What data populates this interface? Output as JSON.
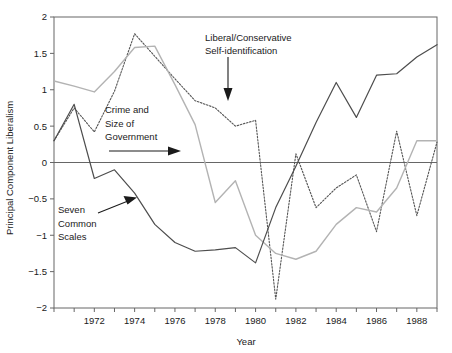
{
  "chart_data": {
    "type": "line",
    "title": "",
    "xlabel": "Year",
    "ylabel": "Principal Component Liberalism",
    "xlim": [
      1970,
      1989
    ],
    "ylim": [
      -2,
      2
    ],
    "x": [
      1970,
      1971,
      1972,
      1973,
      1974,
      1975,
      1976,
      1977,
      1978,
      1979,
      1980,
      1981,
      1982,
      1983,
      1984,
      1985,
      1986,
      1987,
      1988,
      1989
    ],
    "xticks": [
      1970,
      1971,
      1972,
      1973,
      1974,
      1975,
      1976,
      1977,
      1978,
      1979,
      1980,
      1981,
      1982,
      1983,
      1984,
      1985,
      1986,
      1987,
      1988,
      1989
    ],
    "xtick_labels": [
      "",
      "",
      "1972",
      "",
      "1974",
      "",
      "1976",
      "",
      "1978",
      "",
      "1980",
      "",
      "1982",
      "",
      "1984",
      "",
      "1986",
      "",
      "1988",
      ""
    ],
    "yticks": [
      -2,
      -1.5,
      -1,
      -0.5,
      0,
      0.5,
      1,
      1.5,
      2
    ],
    "ytick_labels": [
      "−2",
      "−1.5",
      "−1",
      "−0.5",
      "0",
      "0.5",
      "1",
      "1.5",
      "2"
    ],
    "grid": false,
    "legend": "none",
    "zero_line": true,
    "series": [
      {
        "name": "Crime and Size of Government",
        "style": "dotted",
        "color": "#555555",
        "values": [
          0.3,
          0.75,
          0.42,
          0.98,
          1.77,
          1.46,
          1.15,
          0.85,
          0.75,
          0.5,
          0.58,
          -1.88,
          0.12,
          -0.62,
          -0.35,
          -0.17,
          -0.95,
          0.43,
          -0.73,
          0.28
        ]
      },
      {
        "name": "Liberal/Conservative Self-identification",
        "style": "solid-light",
        "color": "#b3b3b3",
        "values": [
          1.12,
          1.05,
          0.97,
          1.25,
          1.58,
          1.6,
          1.07,
          0.52,
          -0.55,
          -0.25,
          -1.0,
          -1.25,
          -1.33,
          -1.22,
          -0.85,
          -0.62,
          -0.68,
          -0.35,
          0.3,
          0.3
        ]
      },
      {
        "name": "Seven Common Scales",
        "style": "solid-dark",
        "color": "#4d4d4d",
        "values": [
          0.3,
          0.8,
          -0.22,
          -0.1,
          -0.42,
          -0.85,
          -1.1,
          -1.22,
          -1.2,
          -1.17,
          -1.38,
          -0.62,
          -0.05,
          0.55,
          1.1,
          0.62,
          1.2,
          1.22,
          1.45,
          1.62
        ]
      }
    ],
    "annotations": [
      {
        "name": "liberal-conservative-annotation",
        "label_lines": [
          "Liberal/Conservative",
          "Self-identification"
        ],
        "arrow": "down"
      },
      {
        "name": "crime-government-annotation",
        "label_lines": [
          "Crime and",
          "Size of",
          "Government"
        ],
        "arrow": "right"
      },
      {
        "name": "seven-common-scales-annotation",
        "label_lines": [
          "Seven",
          "Common",
          "Scales"
        ],
        "arrow": "up-right"
      }
    ]
  }
}
